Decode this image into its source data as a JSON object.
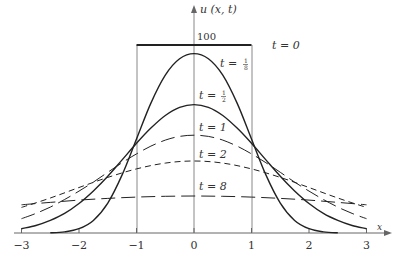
{
  "chart_data": {
    "type": "line",
    "title": "",
    "xlabel": "x",
    "ylabel": "u(x, t)",
    "xlim": [
      -3,
      3
    ],
    "ylim": [
      0,
      100
    ],
    "grid": false,
    "legend_position": "inline labels",
    "x_ticks": [
      "-3",
      "-2",
      "-1",
      "0",
      "1",
      "2",
      "3"
    ],
    "y_ticks": [
      "100"
    ],
    "x": [
      -3,
      -2.75,
      -2.5,
      -2.25,
      -2,
      -1.75,
      -1.5,
      -1.25,
      -1,
      -0.75,
      -0.5,
      -0.25,
      0,
      0.25,
      0.5,
      0.75,
      1,
      1.25,
      1.5,
      1.75,
      2,
      2.25,
      2.5,
      2.75,
      3
    ],
    "series": [
      {
        "name": "t = 0",
        "label": "t = 0",
        "style": "solid-thick",
        "x": [
          -1,
          1
        ],
        "values": [
          100,
          100
        ]
      },
      {
        "name": "t = 1/8",
        "label": "t = 1/8",
        "style": "solid",
        "x": [
          -2.5,
          -2.25,
          -2,
          -1.75,
          -1.5,
          -1.25,
          -1,
          -0.75,
          -0.5,
          -0.25,
          0,
          0.25,
          0.5,
          0.75,
          1,
          1.25,
          1.5,
          1.75,
          2,
          2.25,
          2.5
        ],
        "values": [
          0.1,
          0.6,
          2.3,
          6.7,
          15.9,
          30.9,
          50,
          69.1,
          84.0,
          92.7,
          95.4,
          92.7,
          84.0,
          69.1,
          50,
          30.9,
          15.9,
          6.7,
          2.3,
          0.6,
          0.1
        ]
      },
      {
        "name": "t = 1/2",
        "label": "t = 1/2",
        "style": "solid",
        "x": [
          -3,
          -2.75,
          -2.5,
          -2.25,
          -2,
          -1.75,
          -1.5,
          -1.25,
          -1,
          -0.75,
          -0.5,
          -0.25,
          0,
          0.25,
          0.5,
          0.75,
          1,
          1.25,
          1.5,
          1.75,
          2,
          2.25,
          2.5,
          2.75,
          3
        ],
        "values": [
          2.3,
          4.0,
          6.7,
          10.4,
          15.7,
          22.4,
          30.2,
          38.9,
          47.7,
          55.8,
          62.5,
          66.8,
          68.3,
          66.8,
          62.5,
          55.8,
          47.7,
          38.9,
          30.2,
          22.4,
          15.7,
          10.4,
          6.7,
          4.0,
          2.3
        ]
      },
      {
        "name": "t = 1",
        "label": "t = 1",
        "style": "long-dash",
        "x": [
          -3,
          -2.75,
          -2.5,
          -2.25,
          -2,
          -1.75,
          -1.5,
          -1.25,
          -1,
          -0.75,
          -0.5,
          -0.25,
          0,
          0.25,
          0.5,
          0.75,
          1,
          1.25,
          1.5,
          1.75,
          2,
          2.25,
          2.5,
          2.75,
          3
        ],
        "values": [
          7.6,
          10.4,
          13.8,
          17.8,
          22.3,
          27.1,
          32.3,
          37.4,
          42.1,
          46.2,
          49.4,
          51.4,
          52.0,
          51.4,
          49.4,
          46.2,
          42.1,
          37.4,
          32.3,
          27.1,
          22.3,
          17.8,
          13.8,
          10.4,
          7.6
        ]
      },
      {
        "name": "t = 2",
        "label": "t = 2",
        "style": "short-dash",
        "x": [
          -3,
          -2.5,
          -2,
          -1.5,
          -1,
          -0.5,
          0,
          0.5,
          1,
          1.5,
          2,
          2.5,
          3
        ],
        "values": [
          13.6,
          18.6,
          24.2,
          29.6,
          34.1,
          37.2,
          38.3,
          37.2,
          34.1,
          29.6,
          24.2,
          18.6,
          13.6
        ]
      },
      {
        "name": "t = 8",
        "label": "t = 8",
        "style": "long-dash",
        "x": [
          -3,
          -2.5,
          -2,
          -1.5,
          -1,
          -0.5,
          0,
          0.5,
          1,
          1.5,
          2,
          2.5,
          3
        ],
        "values": [
          15.0,
          16.3,
          17.5,
          18.4,
          19.1,
          19.5,
          19.7,
          19.5,
          19.1,
          18.4,
          17.5,
          16.3,
          15.0
        ]
      }
    ],
    "annotations": [
      {
        "text": "100",
        "x": 0.05,
        "y": 100
      },
      {
        "text": "t = 0",
        "x": 1.3,
        "y": 100
      },
      {
        "text": "t = 1/8",
        "x": 0.55,
        "y": 86
      },
      {
        "text": "t = 1/2",
        "x": 0.1,
        "y": 74
      },
      {
        "text": "t = 1",
        "x": 0.1,
        "y": 58
      },
      {
        "text": "t = 2",
        "x": 0.1,
        "y": 44
      },
      {
        "text": "t = 8",
        "x": 0.1,
        "y": 27
      }
    ]
  },
  "labels": {
    "y_axis": "u (x, t)",
    "x_axis": "x",
    "y_tick_100": "100",
    "x_ticks": [
      "−3",
      "−2",
      "−1",
      "0",
      "1",
      "2",
      "3"
    ],
    "curve_t0": "t = 0",
    "curve_t1_8_prefix": "t = ",
    "curve_t1_8_num": "1",
    "curve_t1_8_den": "8",
    "curve_t1_2_prefix": "t = ",
    "curve_t1_2_num": "1",
    "curve_t1_2_den": "2",
    "curve_t1": "t = 1",
    "curve_t2": "t = 2",
    "curve_t8": "t = 8"
  },
  "colors": {
    "ink": "#222222",
    "axis": "#666666",
    "text": "#333333"
  }
}
